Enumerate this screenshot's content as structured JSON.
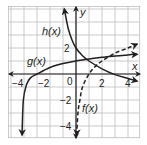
{
  "chart_data": {
    "type": "line",
    "title": "",
    "xlabel": "x",
    "ylabel": "y",
    "xlim": [
      -5.2,
      4.9
    ],
    "ylim": [
      -4.9,
      5.2
    ],
    "grid": true,
    "grid_step": 1,
    "x_ticks": [
      -4,
      -2,
      0,
      2,
      4
    ],
    "y_ticks": [
      2,
      -2,
      -4
    ],
    "tick_labels": {
      "x": [
        "−4",
        "−2",
        "0",
        "2",
        "4"
      ],
      "y": [
        "2",
        "−2",
        "−4"
      ]
    },
    "series": [
      {
        "name": "h(x)",
        "style": "solid",
        "vertical_asymptote": -1,
        "points": [
          [
            -0.9,
            5.0
          ],
          [
            -0.6,
            3.5
          ],
          [
            -0.3,
            2.6
          ],
          [
            0,
            2.0
          ],
          [
            0.5,
            1.4
          ],
          [
            1,
            1.0
          ],
          [
            2,
            0.4
          ],
          [
            3,
            -0.05
          ],
          [
            4,
            -0.35
          ],
          [
            4.7,
            -0.55
          ]
        ],
        "label_position": [
          -1.8,
          3.4
        ]
      },
      {
        "name": "g(x)",
        "style": "solid",
        "vertical_asymptote": -4.3,
        "points": [
          [
            -4.15,
            -4.7
          ],
          [
            -4.05,
            -2.0
          ],
          [
            -3.8,
            -0.8
          ],
          [
            -3.5,
            -0.3
          ],
          [
            -3,
            0.0
          ],
          [
            -2,
            0.5
          ],
          [
            -1,
            0.8
          ],
          [
            0,
            1.0
          ],
          [
            1,
            1.15
          ],
          [
            2,
            1.28
          ],
          [
            3,
            1.38
          ],
          [
            4,
            1.47
          ],
          [
            4.7,
            1.52
          ]
        ],
        "label_position": [
          -3.9,
          1.0
        ]
      },
      {
        "name": "f(x)",
        "style": "dashed",
        "vertical_asymptote": 0,
        "points": [
          [
            0.05,
            -4.7
          ],
          [
            0.15,
            -3.0
          ],
          [
            0.3,
            -2.0
          ],
          [
            0.5,
            -1.0
          ],
          [
            1,
            0.0
          ],
          [
            1.5,
            0.6
          ],
          [
            2,
            1.0
          ],
          [
            3,
            1.6
          ],
          [
            4,
            2.0
          ],
          [
            4.7,
            2.3
          ]
        ],
        "label_position": [
          0.6,
          -2.8
        ]
      }
    ],
    "legend": "none — curves labeled inline",
    "colors": {
      "curve": "#231f20",
      "grid": "#bdbdbd",
      "axis": "#231f20",
      "background": "#ffffff"
    }
  },
  "axes": {
    "x_label": "x",
    "y_label": "y"
  },
  "labels": {
    "h": "h(x)",
    "g": "g(x)",
    "f": "f(x)"
  },
  "ticks": {
    "x_neg4": "−4",
    "x_neg2": "−2",
    "x_0": "0",
    "x_2": "2",
    "x_4": "4",
    "y_2": "2",
    "y_neg2": "−2",
    "y_neg4": "−4"
  }
}
